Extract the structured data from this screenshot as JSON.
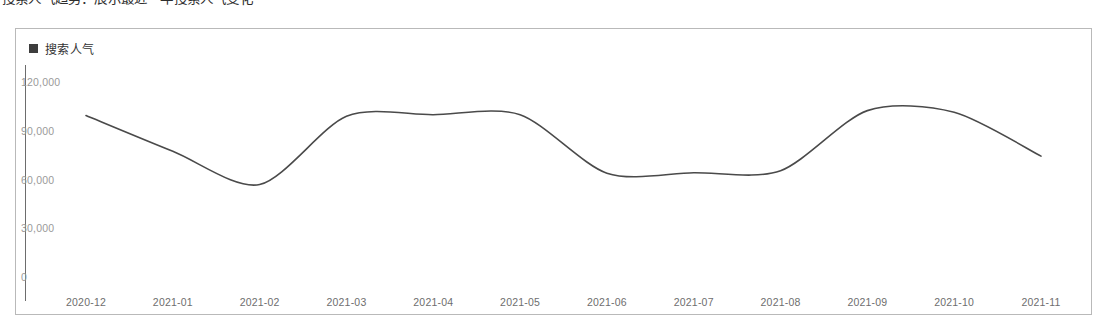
{
  "page": {
    "cut_off_heading": "搜索人气趋势：展示最近一年搜索人气变化"
  },
  "legend": {
    "marker_color": "#3d3d3d",
    "label": "搜索人气"
  },
  "chart_data": {
    "type": "line",
    "title": "",
    "subtitle": "",
    "xlabel": "",
    "ylabel": "",
    "grid": false,
    "legend_position": "top-left",
    "line_color": "#4a4a4a",
    "line_width": 1.6,
    "smooth": true,
    "categories": [
      "2020-12",
      "2021-01",
      "2021-02",
      "2021-03",
      "2021-04",
      "2021-05",
      "2021-06",
      "2021-07",
      "2021-08",
      "2021-09",
      "2021-10",
      "2021-11"
    ],
    "series": [
      {
        "name": "搜索人气",
        "values": [
          100000,
          78000,
          57500,
          99500,
          100500,
          100500,
          64500,
          64800,
          66000,
          103000,
          102000,
          75000
        ]
      }
    ],
    "ylim": [
      0,
      120000
    ],
    "yticks": [
      0,
      30000,
      60000,
      90000,
      120000
    ],
    "ytick_labels": [
      "0",
      "30,000",
      "60,000",
      "90,000",
      "120,000"
    ],
    "xtick_labels": [
      "2020-12",
      "2021-01",
      "2021-02",
      "2021-03",
      "2021-04",
      "2021-05",
      "2021-06",
      "2021-07",
      "2021-08",
      "2021-09",
      "2021-10",
      "2021-11"
    ]
  }
}
